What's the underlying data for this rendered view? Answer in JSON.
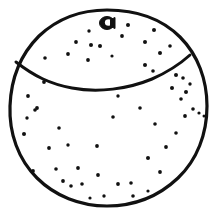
{
  "artwork": {
    "title": "Orange",
    "subject": "citrus-fruit",
    "style": "black-and-white line art with stippled texture",
    "background_color": "#ffffff",
    "ink_color": "#111111",
    "canvas": {
      "width": 216,
      "height": 214
    }
  },
  "shapes": {
    "outline": {
      "name": "fruit-body-outline",
      "description": "Hand-drawn irregular circle forming the body of the orange",
      "stroke_color": "#111111",
      "stroke_width": 3.2,
      "fill_color": "#ffffff",
      "path": "M 107 10 C 138 10 163 20 180 37 C 198 55 207 80 207 106 C 207 134 197 160 178 178 C 159 196 134 206 107 206 C 80 206 55 196 37 178 C 18 159 9 133 10 106 C 11 79 21 54 39 36 C 57 19 80 10 107 10 Z"
    },
    "equator": {
      "name": "equator-seam-line",
      "description": "Curved seam line separating the top cap from the lower body",
      "stroke_color": "#111111",
      "stroke_width": 3.0,
      "path": "M 16 62 C 34 76 50 84 72 88 C 98 93 128 89 152 79 C 168 72 180 64 190 55"
    },
    "navel": {
      "name": "stem-navel-mark",
      "description": "Dark stem blob at the top of the fruit with a small white crescent highlight",
      "center_x": 107,
      "center_y": 23,
      "radius_x": 7.5,
      "radius_y": 6.5,
      "fill_color": "#111111",
      "highlight": {
        "cx": 108.5,
        "cy": 22.5,
        "rx": 3.6,
        "ry": 3.2,
        "color": "#ffffff"
      }
    },
    "specks": {
      "name": "pore-speckles",
      "description": "Small filled dots representing the dimpled pores of the orange peel",
      "color": "#111111",
      "count": 57,
      "points": [
        {
          "x": 89,
          "y": 31,
          "r": 1.7
        },
        {
          "x": 128,
          "y": 25,
          "r": 2.0
        },
        {
          "x": 76,
          "y": 42,
          "r": 1.9
        },
        {
          "x": 122,
          "y": 36,
          "r": 1.9
        },
        {
          "x": 154,
          "y": 30,
          "r": 2.0
        },
        {
          "x": 91,
          "y": 45,
          "r": 2.0
        },
        {
          "x": 100,
          "y": 46,
          "r": 2.0
        },
        {
          "x": 145,
          "y": 42,
          "r": 2.0
        },
        {
          "x": 68,
          "y": 54,
          "r": 1.9
        },
        {
          "x": 88,
          "y": 60,
          "r": 1.9
        },
        {
          "x": 160,
          "y": 53,
          "r": 2.0
        },
        {
          "x": 170,
          "y": 46,
          "r": 1.8
        },
        {
          "x": 112,
          "y": 56,
          "r": 1.6
        },
        {
          "x": 145,
          "y": 65,
          "r": 2.0
        },
        {
          "x": 153,
          "y": 71,
          "r": 1.8
        },
        {
          "x": 176,
          "y": 75,
          "r": 2.0
        },
        {
          "x": 183,
          "y": 78,
          "r": 1.8
        },
        {
          "x": 172,
          "y": 88,
          "r": 2.0
        },
        {
          "x": 186,
          "y": 92,
          "r": 2.0
        },
        {
          "x": 190,
          "y": 84,
          "r": 1.7
        },
        {
          "x": 181,
          "y": 99,
          "r": 1.8
        },
        {
          "x": 193,
          "y": 109,
          "r": 1.8
        },
        {
          "x": 199,
          "y": 113,
          "r": 1.6
        },
        {
          "x": 185,
          "y": 116,
          "r": 1.9
        },
        {
          "x": 44,
          "y": 82,
          "r": 1.9
        },
        {
          "x": 28,
          "y": 96,
          "r": 1.9
        },
        {
          "x": 37,
          "y": 108,
          "r": 1.9
        },
        {
          "x": 24,
          "y": 134,
          "r": 2.0
        },
        {
          "x": 35,
          "y": 110,
          "r": 1.8
        },
        {
          "x": 59,
          "y": 128,
          "r": 1.8
        },
        {
          "x": 49,
          "y": 148,
          "r": 1.9
        },
        {
          "x": 33,
          "y": 171,
          "r": 1.9
        },
        {
          "x": 56,
          "y": 169,
          "r": 1.8
        },
        {
          "x": 68,
          "y": 145,
          "r": 1.7
        },
        {
          "x": 78,
          "y": 168,
          "r": 1.9
        },
        {
          "x": 63,
          "y": 181,
          "r": 1.9
        },
        {
          "x": 71,
          "y": 186,
          "r": 1.8
        },
        {
          "x": 82,
          "y": 184,
          "r": 1.8
        },
        {
          "x": 98,
          "y": 175,
          "r": 1.9
        },
        {
          "x": 113,
          "y": 117,
          "r": 1.8
        },
        {
          "x": 97,
          "y": 146,
          "r": 1.9
        },
        {
          "x": 118,
          "y": 184,
          "r": 1.9
        },
        {
          "x": 131,
          "y": 183,
          "r": 1.8
        },
        {
          "x": 133,
          "y": 196,
          "r": 1.8
        },
        {
          "x": 104,
          "y": 196,
          "r": 1.7
        },
        {
          "x": 90,
          "y": 198,
          "r": 1.6
        },
        {
          "x": 148,
          "y": 158,
          "r": 2.0
        },
        {
          "x": 160,
          "y": 172,
          "r": 1.9
        },
        {
          "x": 166,
          "y": 147,
          "r": 1.9
        },
        {
          "x": 176,
          "y": 133,
          "r": 1.8
        },
        {
          "x": 155,
          "y": 124,
          "r": 1.8
        },
        {
          "x": 140,
          "y": 108,
          "r": 1.8
        },
        {
          "x": 118,
          "y": 96,
          "r": 1.7
        },
        {
          "x": 45,
          "y": 58,
          "r": 1.8
        },
        {
          "x": 204,
          "y": 116,
          "r": 1.5
        },
        {
          "x": 148,
          "y": 191,
          "r": 1.6
        },
        {
          "x": 27,
          "y": 118,
          "r": 1.7
        }
      ]
    }
  }
}
